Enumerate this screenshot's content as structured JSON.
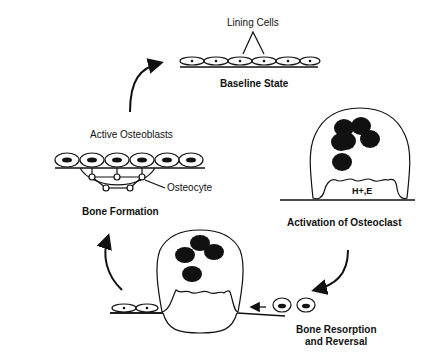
{
  "diagram": {
    "type": "bone remodeling cycle",
    "stages": [
      {
        "id": "baseline",
        "title": "Baseline State",
        "annotation": "Lining Cells"
      },
      {
        "id": "activation",
        "title": "Activation of Osteoclast",
        "annotation": "H+,E"
      },
      {
        "id": "resorption",
        "title_line1": "Bone Resorption",
        "title_line2": "and Reversal"
      },
      {
        "id": "formation",
        "title": "Bone Formation",
        "annotation_top": "Active Osteoblasts",
        "annotation_side": "Osteocyte"
      }
    ],
    "flow": [
      "baseline",
      "activation",
      "resorption",
      "formation",
      "baseline"
    ]
  }
}
